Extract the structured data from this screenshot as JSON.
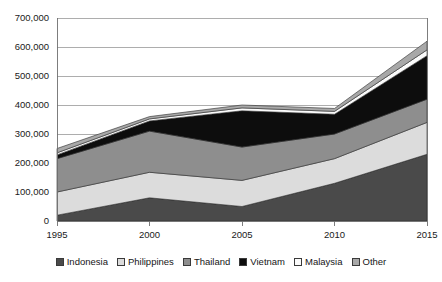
{
  "chart_data": {
    "type": "area",
    "stacked": true,
    "title": "",
    "xlabel": "",
    "ylabel": "",
    "x": [
      1995,
      2000,
      2005,
      2010,
      2015
    ],
    "xtick_labels": [
      "1995",
      "2000",
      "2005",
      "2010",
      "2015"
    ],
    "ytick_labels": [
      "0",
      "100,000",
      "200,000",
      "300,000",
      "400,000",
      "500,000",
      "600,000",
      "700,000"
    ],
    "ytick_values": [
      0,
      100000,
      200000,
      300000,
      400000,
      500000,
      600000,
      700000
    ],
    "ylim": [
      0,
      700000
    ],
    "grid": true,
    "legend_position": "bottom",
    "series": [
      {
        "name": "Indonesia",
        "color": "#4a4a4a",
        "values": [
          20000,
          80000,
          50000,
          130000,
          230000
        ]
      },
      {
        "name": "Philippines",
        "color": "#dcdcdc",
        "values": [
          80000,
          88000,
          90000,
          85000,
          110000
        ]
      },
      {
        "name": "Thailand",
        "color": "#8e8e8e",
        "values": [
          115000,
          142000,
          115000,
          85000,
          80000
        ]
      },
      {
        "name": "Vietnam",
        "color": "#0d0d0d",
        "values": [
          13000,
          35000,
          125000,
          68000,
          150000
        ]
      },
      {
        "name": "Malaysia",
        "color": "#fbfbfb",
        "values": [
          7000,
          7000,
          10000,
          10000,
          20000
        ]
      },
      {
        "name": "Other",
        "color": "#a8a8a8",
        "values": [
          15000,
          8000,
          10000,
          10000,
          30000
        ]
      }
    ],
    "totals": [
      250000,
      360000,
      400000,
      388000,
      620000
    ]
  },
  "legend": {
    "items": [
      {
        "label": "Indonesia"
      },
      {
        "label": "Philippines"
      },
      {
        "label": "Thailand"
      },
      {
        "label": "Vietnam"
      },
      {
        "label": "Malaysia"
      },
      {
        "label": "Other"
      }
    ]
  }
}
